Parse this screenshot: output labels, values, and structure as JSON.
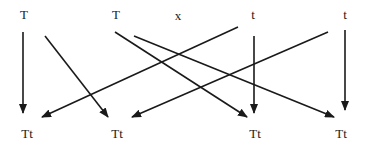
{
  "diagram": {
    "type": "genetic-cross",
    "parents": [
      {
        "id": "p1",
        "label": "T",
        "x": 24,
        "y": 8
      },
      {
        "id": "p2",
        "label": "T",
        "x": 116,
        "y": 8
      },
      {
        "id": "p3",
        "label": "t",
        "x": 253,
        "y": 8
      },
      {
        "id": "p4",
        "label": "t",
        "x": 345,
        "y": 8
      }
    ],
    "cross_symbol": {
      "label": "x",
      "x": 178,
      "y": 9
    },
    "offspring": [
      {
        "id": "o1",
        "label": "Tt",
        "x": 27,
        "y": 127
      },
      {
        "id": "o2",
        "label": "Tt",
        "x": 117,
        "y": 127
      },
      {
        "id": "o3",
        "label": "Tt",
        "x": 255,
        "y": 127
      },
      {
        "id": "o4",
        "label": "Tt",
        "x": 341,
        "y": 127
      }
    ],
    "arrows": [
      {
        "from": "p1",
        "to": "o1",
        "x1": 23,
        "y1": 32,
        "x2": 23,
        "y2": 113
      },
      {
        "from": "p1",
        "to": "o2",
        "x1": 45,
        "y1": 36,
        "x2": 108,
        "y2": 117
      },
      {
        "from": "p2",
        "to": "o3",
        "x1": 115,
        "y1": 32,
        "x2": 247,
        "y2": 117
      },
      {
        "from": "p2",
        "to": "o4",
        "x1": 134,
        "y1": 36,
        "x2": 334,
        "y2": 117
      },
      {
        "from": "p3",
        "to": "o1",
        "x1": 238,
        "y1": 27,
        "x2": 42,
        "y2": 117
      },
      {
        "from": "p3",
        "to": "o3",
        "x1": 254,
        "y1": 36,
        "x2": 254,
        "y2": 113
      },
      {
        "from": "p4",
        "to": "o2",
        "x1": 328,
        "y1": 32,
        "x2": 132,
        "y2": 117
      },
      {
        "from": "p4",
        "to": "o4",
        "x1": 345,
        "y1": 30,
        "x2": 345,
        "y2": 110
      }
    ],
    "colors": {
      "line": "#1a1a1a",
      "background": "#ffffff"
    }
  }
}
